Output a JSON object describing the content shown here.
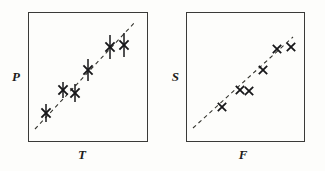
{
  "figure": {
    "width": 325,
    "height": 171,
    "background_color": "#fdfdfb",
    "ink_color": "#17171a",
    "frame_color": "#3a3a38",
    "trend_color": "#35352f"
  },
  "panels": [
    {
      "id": "left-panel",
      "name": "panel-p-vs-t",
      "frame": {
        "x": 28,
        "y": 12,
        "width": 120,
        "height": 130
      },
      "y_axis_label": "P",
      "x_axis_label": "T",
      "y_label_pos": {
        "x": 10,
        "y": 70
      },
      "x_label_pos": {
        "x": 82,
        "y": 148
      },
      "has_error_bars": true,
      "marker_symbol": "x",
      "marker_size": 4.6,
      "marker_stroke": 1.9,
      "error_bar_stroke": 1.5,
      "trend_line": {
        "x1": 35,
        "y1": 129,
        "x2": 136,
        "y2": 21,
        "dash": "4,3.4",
        "stroke_width": 1.1
      },
      "points": [
        {
          "x": 46,
          "y": 113,
          "err": 9
        },
        {
          "x": 63,
          "y": 90,
          "err": 8
        },
        {
          "x": 75,
          "y": 93,
          "err": 9
        },
        {
          "x": 88,
          "y": 70,
          "err": 11
        },
        {
          "x": 110,
          "y": 47,
          "err": 12
        },
        {
          "x": 124,
          "y": 45,
          "err": 12
        }
      ]
    },
    {
      "id": "right-panel",
      "name": "panel-s-vs-f",
      "frame": {
        "x": 186,
        "y": 12,
        "width": 119,
        "height": 130
      },
      "y_axis_label": "S",
      "x_axis_label": "F",
      "y_label_pos": {
        "x": 169,
        "y": 70
      },
      "x_label_pos": {
        "x": 243,
        "y": 148
      },
      "has_error_bars": false,
      "marker_symbol": "x",
      "marker_size": 4.2,
      "marker_stroke": 1.8,
      "error_bar_stroke": 0,
      "trend_line": {
        "x1": 193,
        "y1": 128,
        "x2": 293,
        "y2": 37,
        "dash": "4,3.4",
        "stroke_width": 1.1
      },
      "points": [
        {
          "x": 222,
          "y": 107,
          "err": 0
        },
        {
          "x": 240,
          "y": 90,
          "err": 0
        },
        {
          "x": 249,
          "y": 91,
          "err": 0
        },
        {
          "x": 263,
          "y": 70,
          "err": 0
        },
        {
          "x": 277,
          "y": 49,
          "err": 0
        },
        {
          "x": 291,
          "y": 47,
          "err": 0
        }
      ]
    }
  ],
  "chart_data": [
    {
      "type": "scatter",
      "title": "",
      "xlabel": "T",
      "ylabel": "P",
      "grid": false,
      "legend": "none",
      "axis_ticks": "none",
      "series": [
        {
          "name": "P vs T measurements",
          "marker": "x",
          "error_bars": "vertical",
          "points": [
            {
              "x": 0.15,
              "y": 0.15,
              "yerr": 0.07
            },
            {
              "x": 0.29,
              "y": 0.33,
              "yerr": 0.06
            },
            {
              "x": 0.39,
              "y": 0.3,
              "yerr": 0.07
            },
            {
              "x": 0.5,
              "y": 0.48,
              "yerr": 0.085
            },
            {
              "x": 0.68,
              "y": 0.66,
              "yerr": 0.09
            },
            {
              "x": 0.8,
              "y": 0.68,
              "yerr": 0.09
            }
          ]
        },
        {
          "name": "fitted trend line",
          "type": "line",
          "style": "dashed",
          "x": [
            0.06,
            0.9
          ],
          "y": [
            0.1,
            0.93
          ]
        }
      ],
      "xlim": [
        0,
        1
      ],
      "ylim": [
        0,
        1
      ]
    },
    {
      "type": "scatter",
      "title": "",
      "xlabel": "F",
      "ylabel": "S",
      "grid": false,
      "legend": "none",
      "axis_ticks": "none",
      "series": [
        {
          "name": "S vs F measurements",
          "marker": "x",
          "error_bars": "none",
          "points": [
            {
              "x": 0.3,
              "y": 0.2
            },
            {
              "x": 0.45,
              "y": 0.33
            },
            {
              "x": 0.53,
              "y": 0.32
            },
            {
              "x": 0.65,
              "y": 0.48
            },
            {
              "x": 0.76,
              "y": 0.64
            },
            {
              "x": 0.88,
              "y": 0.66
            }
          ]
        },
        {
          "name": "fitted trend line",
          "type": "line",
          "style": "dashed",
          "x": [
            0.06,
            0.9
          ],
          "y": [
            0.11,
            0.81
          ]
        }
      ],
      "xlim": [
        0,
        1
      ],
      "ylim": [
        0,
        1
      ]
    }
  ]
}
